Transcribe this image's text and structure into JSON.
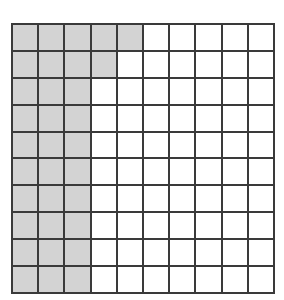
{
  "grid": {
    "rows": 10,
    "cols": 10,
    "shaded_color": "#d3d3d3",
    "unshaded_color": "#ffffff",
    "line_color": "#3a3a3a",
    "shaded_per_row": [
      5,
      4,
      3,
      3,
      3,
      3,
      3,
      3,
      3,
      3
    ],
    "total_shaded": 33,
    "total_cells": 100
  }
}
